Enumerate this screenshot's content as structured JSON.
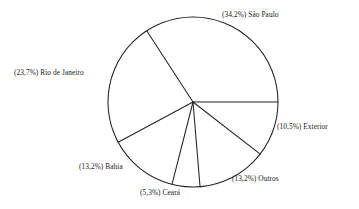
{
  "chart_data": {
    "type": "pie",
    "title": "",
    "subtitle": "",
    "xlabel": "",
    "ylabel": "",
    "legend_position": "none",
    "grid": false,
    "value_unit": "percent",
    "decimal_separator": ",",
    "label_format": "(value%) category",
    "start_angle_deg": 0,
    "direction": "counterclockwise",
    "categories": [
      "São Paulo",
      "Rio de Janeiro",
      "Bahia",
      "Ceará",
      "Outros",
      "Exterior"
    ],
    "values": [
      34.2,
      23.7,
      13.2,
      5.3,
      13.2,
      10.5
    ],
    "slices": [
      {
        "category": "São Paulo",
        "value": 34.2,
        "label": "(34,2%) São Paulo"
      },
      {
        "category": "Rio de Janeiro",
        "value": 23.7,
        "label": "(23,7%) Rio de Janeiro"
      },
      {
        "category": "Bahia",
        "value": 13.2,
        "label": "(13,2%) Bahia"
      },
      {
        "category": "Ceará",
        "value": 5.3,
        "label": "(5,3%) Ceará"
      },
      {
        "category": "Outros",
        "value": 13.2,
        "label": "(13,2%) Outros"
      },
      {
        "category": "Exterior",
        "value": 10.5,
        "label": "(10,5%) Exterior"
      }
    ]
  },
  "geometry": {
    "center_x": 193,
    "center_y": 102,
    "radius": 85
  },
  "style": {
    "line_color": "#232323",
    "background": "#ffffff",
    "text_color": "#1c1c1c"
  }
}
